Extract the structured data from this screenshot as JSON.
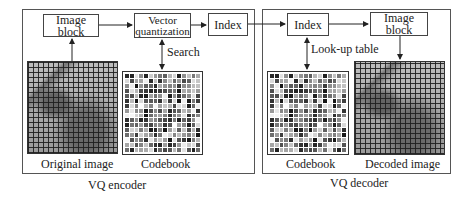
{
  "encoder": {
    "title": "VQ encoder",
    "image_block": "Image block",
    "vq_line1": "Vector",
    "vq_line2": "quantization",
    "index": "Index",
    "search_label": "Search",
    "original_image_label": "Original image",
    "codebook_label": "Codebook"
  },
  "decoder": {
    "title": "VQ decoder",
    "index": "Index",
    "image_block": "Image block",
    "lookup_label": "Look-up table",
    "codebook_label": "Codebook",
    "decoded_image_label": "Decoded image"
  },
  "edges": [
    {
      "from": "Original image",
      "to": "Image block (encoder)"
    },
    {
      "from": "Image block (encoder)",
      "to": "Vector quantization"
    },
    {
      "from": "Vector quantization",
      "to": "Codebook (encoder)",
      "label": "Search",
      "bidirectional": true
    },
    {
      "from": "Vector quantization",
      "to": "Index (encoder)"
    },
    {
      "from": "Index (encoder)",
      "to": "Index (decoder)"
    },
    {
      "from": "Index (decoder)",
      "to": "Codebook (decoder)",
      "label": "Look-up table",
      "bidirectional": true
    },
    {
      "from": "Index (decoder)",
      "to": "Image block (decoder)"
    },
    {
      "from": "Image block (decoder)",
      "to": "Decoded image"
    }
  ]
}
